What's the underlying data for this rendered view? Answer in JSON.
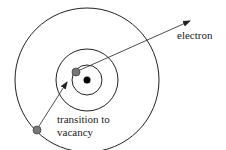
{
  "diagram": {
    "type": "atomic-shell-transition",
    "labels": {
      "electron": "electron",
      "transition_line1": "transition to",
      "transition_line2": "vacancy"
    },
    "colors": {
      "line": "#222222",
      "nucleus": "#000000",
      "electron_fill": "#777777",
      "electron_stroke": "#444444",
      "background": "#ffffff"
    },
    "nucleus": {
      "cx": 87,
      "cy": 80,
      "r": 3.5
    },
    "shells": [
      {
        "name": "inner-shell",
        "r": 15
      },
      {
        "name": "middle-shell",
        "r": 31
      },
      {
        "name": "outer-shell",
        "r": 72
      }
    ],
    "electrons": [
      {
        "name": "ejected-electron-vacancy",
        "cx": 76,
        "cy": 72,
        "r": 4
      },
      {
        "name": "outer-shell-electron",
        "cx": 37,
        "cy": 130,
        "r": 4
      }
    ],
    "arrows": [
      {
        "name": "ejection-arrow",
        "x1": 80,
        "y1": 70,
        "x2": 190,
        "y2": 21
      },
      {
        "name": "transition-arrow",
        "x1": 39,
        "y1": 126,
        "x2": 67,
        "y2": 82
      }
    ]
  }
}
